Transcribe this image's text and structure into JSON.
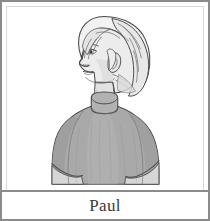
{
  "card": {
    "name_label": "Paul",
    "border_color": "#8b8b8b",
    "background_color": "#ffffff"
  },
  "portrait": {
    "alt_text": "Paul",
    "description": "Pencil line drawing of a person in left-facing profile, head and shoulders",
    "subject_orientation": "left-facing profile",
    "colors": {
      "hair": "#f2f2f2",
      "hair_shadow": "#e0e0e0",
      "skin": "#ececec",
      "skin_shadow": "#d9d9d9",
      "shirt": "#a9a9a9",
      "shirt_shadow": "#9a9a9a",
      "shirt_highlight": "#b6b6b6",
      "collar": "#b0b0b0",
      "arm": "#d5d5d5",
      "outline": "#4a4a4a",
      "background": "#ffffff"
    }
  },
  "label_bar": {
    "text": "Paul",
    "text_color": "#3a3a3a"
  }
}
